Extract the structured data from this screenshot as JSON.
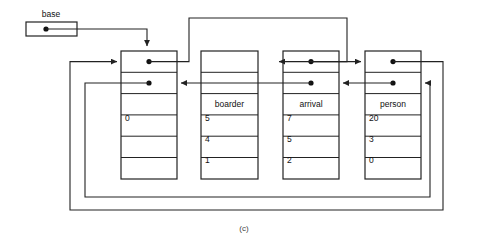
{
  "figure": {
    "caption": "(c)",
    "base_label": "base",
    "stroke_color": "#222222",
    "text_color": "#111111",
    "background": "#ffffff"
  },
  "base_pointer": {
    "name": "base",
    "label": "base",
    "dot": "filled-dot"
  },
  "nodes": [
    {
      "id": "node-head",
      "name": "",
      "cells": [
        "",
        "",
        "",
        "0",
        "",
        ""
      ],
      "pointer_rows": [
        0,
        1
      ],
      "name_row": 2,
      "x": 121,
      "y": 51,
      "w": 56,
      "h": 128
    },
    {
      "id": "node-boarder",
      "name": "boarder",
      "cells": [
        "",
        "",
        "boarder",
        "5",
        "4",
        "1"
      ],
      "pointer_rows": [
        0,
        1
      ],
      "name_row": 2,
      "x": 201,
      "y": 51,
      "w": 57,
      "h": 128
    },
    {
      "id": "node-arrival",
      "name": "arrival",
      "cells": [
        "",
        "",
        "arrival",
        "7",
        "5",
        "2"
      ],
      "pointer_rows": [
        0,
        1
      ],
      "name_row": 2,
      "x": 283,
      "y": 51,
      "w": 56,
      "h": 128
    },
    {
      "id": "node-person",
      "name": "person",
      "cells": [
        "",
        "",
        "person",
        "20",
        "3",
        "0"
      ],
      "pointer_rows": [
        0,
        1
      ],
      "name_row": 2,
      "x": 365,
      "y": 51,
      "w": 56,
      "h": 128
    }
  ],
  "axis_note": {
    "rows_per_node": 6,
    "row_height": 21.3
  }
}
